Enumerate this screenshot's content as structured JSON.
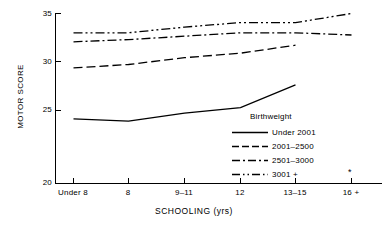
{
  "chart_data": {
    "type": "line",
    "title": "",
    "xlabel": "SCHOOLING (yrs)",
    "ylabel": "MOTOR SCORE",
    "categories": [
      "Under 8",
      "8",
      "9–11",
      "12",
      "13–15",
      "16 +"
    ],
    "ylim": [
      20,
      35
    ],
    "yticks": [
      20,
      25,
      30,
      35
    ],
    "ytick_labels": [
      "20",
      "25",
      "30",
      "35"
    ],
    "grid": false,
    "legend_position": "inside-lower-right",
    "legend_title": "Birthweight",
    "series": [
      {
        "name": "Under 2001",
        "style": "solid",
        "values": [
          25.7,
          25.5,
          26.2,
          26.7,
          28.7,
          null
        ]
      },
      {
        "name": "2001–2500",
        "style": "dashed",
        "values": [
          30.2,
          30.5,
          31.1,
          31.5,
          32.2,
          null
        ]
      },
      {
        "name": "2501–3000",
        "style": "dash-dot",
        "values": [
          32.5,
          32.7,
          33.0,
          33.3,
          33.3,
          33.1
        ]
      },
      {
        "name": "3001 +",
        "style": "dash-dot-dot",
        "values": [
          33.3,
          33.3,
          33.8,
          34.2,
          34.2,
          35.0
        ]
      }
    ],
    "annotations": [
      {
        "name": "asterisk-marker",
        "text": "*",
        "x_category": "16 +",
        "y": 20.9
      }
    ]
  },
  "axis": {
    "y_title": "MOTOR SCORE",
    "x_title": "SCHOOLING (yrs)"
  },
  "legend": {
    "title": "Birthweight",
    "entries": [
      {
        "label": "Under 2001"
      },
      {
        "label": "2001–2500"
      },
      {
        "label": "2501–3000"
      },
      {
        "label": "3001 +"
      }
    ]
  },
  "colors": {
    "ink": "#000000",
    "background": "#ffffff"
  }
}
